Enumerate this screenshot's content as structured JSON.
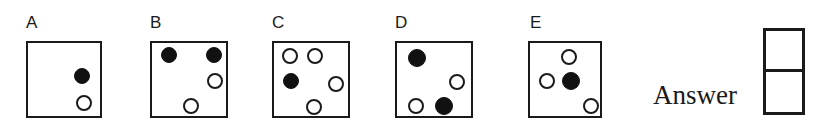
{
  "figure": {
    "kind": "multiple-choice-dot-pattern",
    "background_color": "#ffffff",
    "ink_color": "#1a1a1a",
    "filled_dot_color": "#111111",
    "open_dot_color": "#ffffff"
  },
  "options": [
    {
      "label": "A",
      "label_x": 26,
      "label_y": 14,
      "box": {
        "x": 26,
        "y": 41,
        "width": 76,
        "height": 77
      },
      "dots": [
        {
          "name": "dot-filled-1",
          "fill": "filled",
          "cx": 80,
          "cy": 74,
          "r": 8
        },
        {
          "name": "dot-open-1",
          "fill": "open",
          "cx": 82,
          "cy": 101,
          "r": 8
        }
      ]
    },
    {
      "label": "B",
      "label_x": 150,
      "label_y": 14,
      "box": {
        "x": 150,
        "y": 41,
        "width": 78,
        "height": 77
      },
      "dots": [
        {
          "name": "dot-filled-1",
          "fill": "filled",
          "cx": 167,
          "cy": 53,
          "r": 8
        },
        {
          "name": "dot-filled-2",
          "fill": "filled",
          "cx": 212,
          "cy": 53,
          "r": 8
        },
        {
          "name": "dot-open-1",
          "fill": "open",
          "cx": 213,
          "cy": 79,
          "r": 8
        },
        {
          "name": "dot-open-2",
          "fill": "open",
          "cx": 189,
          "cy": 104,
          "r": 8
        }
      ]
    },
    {
      "label": "C",
      "label_x": 272,
      "label_y": 14,
      "box": {
        "x": 272,
        "y": 41,
        "width": 78,
        "height": 77
      },
      "dots": [
        {
          "name": "dot-open-1",
          "fill": "open",
          "cx": 288,
          "cy": 54,
          "r": 8
        },
        {
          "name": "dot-open-2",
          "fill": "open",
          "cx": 313,
          "cy": 54,
          "r": 8
        },
        {
          "name": "dot-filled-1",
          "fill": "filled",
          "cx": 289,
          "cy": 79,
          "r": 8
        },
        {
          "name": "dot-open-3",
          "fill": "open",
          "cx": 334,
          "cy": 82,
          "r": 8
        },
        {
          "name": "dot-open-4",
          "fill": "open",
          "cx": 312,
          "cy": 105,
          "r": 8
        }
      ]
    },
    {
      "label": "D",
      "label_x": 395,
      "label_y": 14,
      "box": {
        "x": 395,
        "y": 41,
        "width": 78,
        "height": 77
      },
      "dots": [
        {
          "name": "dot-filled-1",
          "fill": "filled",
          "cx": 415,
          "cy": 56,
          "r": 9
        },
        {
          "name": "dot-open-1",
          "fill": "open",
          "cx": 455,
          "cy": 80,
          "r": 8
        },
        {
          "name": "dot-open-2",
          "fill": "open",
          "cx": 414,
          "cy": 104,
          "r": 8
        },
        {
          "name": "dot-filled-2",
          "fill": "filled",
          "cx": 442,
          "cy": 104,
          "r": 9
        }
      ]
    },
    {
      "label": "E",
      "label_x": 530,
      "label_y": 14,
      "box": {
        "x": 528,
        "y": 41,
        "width": 74,
        "height": 77
      },
      "dots": [
        {
          "name": "dot-open-1",
          "fill": "open",
          "cx": 567,
          "cy": 55,
          "r": 8
        },
        {
          "name": "dot-open-2",
          "fill": "open",
          "cx": 545,
          "cy": 79,
          "r": 8
        },
        {
          "name": "dot-filled-1",
          "fill": "filled",
          "cx": 569,
          "cy": 79,
          "r": 9
        },
        {
          "name": "dot-open-3",
          "fill": "open",
          "cx": 589,
          "cy": 104,
          "r": 8
        }
      ]
    }
  ],
  "answer": {
    "label": "Answer",
    "label_x": 653,
    "label_y": 82,
    "box": {
      "x": 763,
      "y": 28,
      "width": 42,
      "height": 87
    },
    "cells": [
      {
        "name": "answer-cell-top",
        "value": ""
      },
      {
        "name": "answer-cell-bottom",
        "value": ""
      }
    ]
  }
}
